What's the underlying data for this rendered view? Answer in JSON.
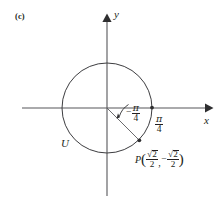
{
  "figure": {
    "part_label": "(c)",
    "axes": {
      "x_label": "x",
      "y_label": "y"
    },
    "circle": {
      "name_label": "U",
      "center": [
        107,
        108
      ],
      "radius": 45
    },
    "angle": {
      "negative_sign": "−",
      "numerator": "π",
      "denominator": "4",
      "text": "−π/4",
      "value_radians": -0.7853981634
    },
    "reference_angle": {
      "numerator": "π",
      "denominator": "4",
      "text": "π/4"
    },
    "point": {
      "name": "P",
      "open_paren": "(",
      "close_paren": ")",
      "comma": ",",
      "x_minus": "",
      "x_num_radicand": "2",
      "x_denominator": "2",
      "y_minus": "−",
      "y_num_radicand": "2",
      "y_denominator": "2",
      "text": "P(√2/2, −√2/2)",
      "coords": [
        139.8,
        140.8
      ]
    },
    "colors": {
      "ink": "#231f20",
      "background": "#ffffff",
      "axis": "#555557",
      "curve": "#3a3a3c"
    }
  }
}
